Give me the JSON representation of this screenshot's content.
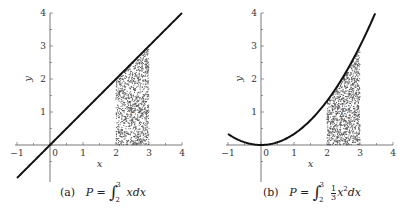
{
  "chart_data": [
    {
      "type": "scatter",
      "panel": "(a)",
      "title": "",
      "caption": {
        "tag": "(a)",
        "formula": "P = ∫_2^3 x dx",
        "lhs": "P =",
        "lower": "2",
        "upper": "3",
        "integrand": "xdx"
      },
      "xlabel": "x",
      "ylabel": "y",
      "xlim": [
        -1,
        4
      ],
      "ylim": [
        -1,
        4
      ],
      "xticks": [
        -1,
        0,
        1,
        2,
        3,
        4
      ],
      "yticks": [
        1,
        2,
        3,
        4
      ],
      "curve": {
        "function": "y = x",
        "x_range": [
          -1,
          4
        ]
      },
      "region": {
        "label": "P",
        "x_range": [
          2,
          3
        ],
        "y_from": 0,
        "y_to": "f(x)",
        "fill": "random points"
      },
      "grid": false
    },
    {
      "type": "scatter",
      "panel": "(b)",
      "title": "",
      "caption": {
        "tag": "(b)",
        "formula": "P = ∫_2^3 (1/3) x^2 dx",
        "lhs": "P =",
        "lower": "2",
        "upper": "3",
        "frac_num": "1",
        "frac_den": "3",
        "integrand": "x",
        "power": "2",
        "dx": "dx"
      },
      "xlabel": "x",
      "ylabel": "y",
      "xlim": [
        -1,
        4
      ],
      "ylim": [
        -1,
        4
      ],
      "xticks": [
        -1,
        0,
        1,
        2,
        3,
        4
      ],
      "yticks": [
        1,
        2,
        3,
        4
      ],
      "curve": {
        "function": "y = x^2/3",
        "x_range": [
          -1,
          3.46
        ]
      },
      "region": {
        "label": "P",
        "x_range": [
          2,
          3
        ],
        "y_from": 0,
        "y_to": "f(x)",
        "fill": "random points"
      },
      "grid": false
    }
  ],
  "panels": [
    {
      "x_origin_px": 50,
      "y_origin_px": 145,
      "unit_px": 33,
      "curve": "linear",
      "tick_labels": [
        "−1",
        "0",
        "1",
        "2",
        "3",
        "4"
      ],
      "y_tick_labels": [
        "1",
        "2",
        "3",
        "4"
      ]
    },
    {
      "x_origin_px": 261,
      "y_origin_px": 145,
      "unit_px": 33,
      "curve": "quadratic",
      "tick_labels": [
        "−1",
        "0",
        "1",
        "2",
        "3",
        "4"
      ],
      "y_tick_labels": [
        "1",
        "2",
        "3",
        "4"
      ]
    }
  ],
  "colors": {
    "curve": "#111111",
    "axis": "#555555",
    "points": "#555555"
  }
}
